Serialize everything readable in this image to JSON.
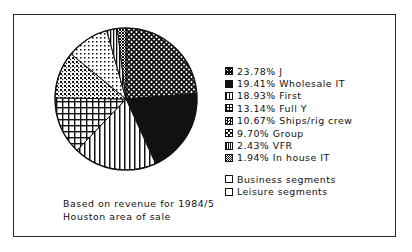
{
  "figure": {
    "caption_line1": "Based on revenue for 1984/5",
    "caption_line2": "Houston area of sale",
    "border_color": "#2b2b2b",
    "background": "#ffffff",
    "ink_color": "#111111"
  },
  "legend": {
    "segment_entries": [
      {
        "percent": "23.78%",
        "name": "J",
        "text": "23.78% J",
        "swatch": "diagonal-crosshatch-dense-swatch"
      },
      {
        "percent": "19.41%",
        "name": "Wholesale IT",
        "text": "19.41% Wholesale IT",
        "swatch": "solid-black-swatch"
      },
      {
        "percent": "18.93%",
        "name": "First",
        "text": "18.93% First",
        "swatch": "vertical-lines-swatch"
      },
      {
        "percent": "13.14%",
        "name": "Full Y",
        "text": "13.14% Full Y",
        "swatch": "grid-crosshatch-swatch"
      },
      {
        "percent": "10.67%",
        "name": "Ships/rig crew",
        "text": "10.67% Ships/rig crew",
        "swatch": "medium-dots-swatch"
      },
      {
        "percent": "9.70%",
        "name": "Group",
        "text": "9.70% Group",
        "swatch": "light-dots-swatch"
      },
      {
        "percent": "2.43%",
        "name": "VFR",
        "text": "2.43% VFR",
        "swatch": "thin-vertical-lines-swatch"
      },
      {
        "percent": "1.94%",
        "name": "In house IT",
        "text": "1.94% In house IT",
        "swatch": "dense-speckle-swatch"
      }
    ],
    "category_entries": [
      {
        "text": "Business segments",
        "swatch": "empty-outline-swatch"
      },
      {
        "text": "Leisure segments",
        "swatch": "empty-outline-swatch"
      }
    ]
  },
  "chart_data": {
    "type": "pie",
    "title": "",
    "subtitle": "",
    "annotations": [
      "Based on revenue for 1984/5",
      "Houston area of sale"
    ],
    "legend_position": "right",
    "start_angle_deg": -90,
    "direction": "clockwise",
    "units": "percent",
    "categories": [
      "J",
      "Wholesale IT",
      "First",
      "Full Y",
      "Ships/rig crew",
      "Group",
      "VFR",
      "In house IT"
    ],
    "values": [
      23.78,
      19.41,
      18.93,
      13.14,
      10.67,
      9.7,
      2.43,
      1.94
    ],
    "slices": [
      {
        "label": "J",
        "value": 23.78,
        "fill": "diagonal-crosshatch-dense"
      },
      {
        "label": "Wholesale IT",
        "value": 19.41,
        "fill": "solid-black"
      },
      {
        "label": "First",
        "value": 18.93,
        "fill": "vertical-lines"
      },
      {
        "label": "Full Y",
        "value": 13.14,
        "fill": "grid-crosshatch"
      },
      {
        "label": "Ships/rig crew",
        "value": 10.67,
        "fill": "medium-dots"
      },
      {
        "label": "Group",
        "value": 9.7,
        "fill": "light-dots"
      },
      {
        "label": "VFR",
        "value": 2.43,
        "fill": "thin-vertical-lines"
      },
      {
        "label": "In house IT",
        "value": 1.94,
        "fill": "dense-speckle"
      }
    ],
    "total": 100.0
  }
}
